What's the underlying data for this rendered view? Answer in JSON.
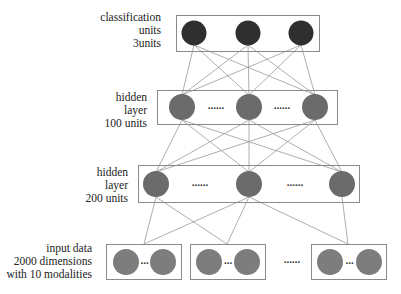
{
  "title": "",
  "colors": {
    "output_node": "#2f2f2f",
    "hidden_node": "#6b6b6b",
    "input_node": "#7d7d7d",
    "box_stroke": "#8a8a8a",
    "edge": "#9a9a9a"
  },
  "layers": {
    "output": {
      "label_lines": [
        "classification",
        "units",
        "3units"
      ],
      "units": 3
    },
    "hidden1": {
      "label_lines": [
        "hidden",
        "layer",
        "100 units"
      ],
      "units": 100,
      "ellipsis": "......"
    },
    "hidden2": {
      "label_lines": [
        "hidden",
        "layer",
        "200 units"
      ],
      "units": 200,
      "ellipsis": "......"
    },
    "input": {
      "label_lines": [
        "input data",
        "2000 dimensions",
        "with 10 modalities"
      ],
      "dimensions": 2000,
      "modalities": 10,
      "inner_ellipsis": "...",
      "group_ellipsis": "......"
    }
  },
  "diagram_data": {
    "type": "neural-network",
    "nodes_shown": {
      "output": 3,
      "hidden1": 3,
      "hidden2": 3,
      "input_groups": 3,
      "nodes_per_input_group": 2
    },
    "connections": [
      "output <-> hidden1: fully connected",
      "hidden1 <-> hidden2: fully connected",
      "input group 1 -> hidden2 nodes 1,2",
      "input group 2 -> hidden2 nodes 1,2",
      "input group 3 -> hidden2 nodes 2,3"
    ]
  }
}
